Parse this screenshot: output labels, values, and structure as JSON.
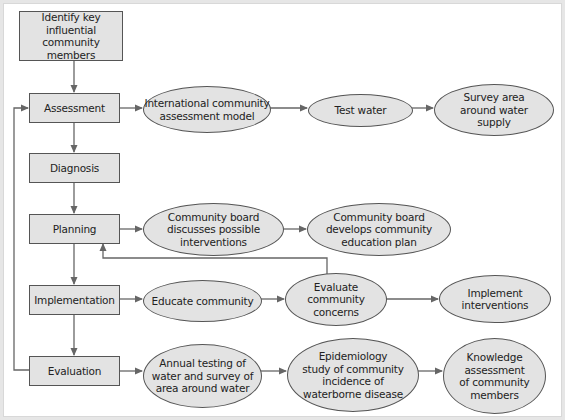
{
  "diagram": {
    "colors": {
      "node_fill": "#e3e3e3",
      "node_border": "#555555",
      "connector": "#666666",
      "background": "#ffffff",
      "frame": "#e6e6e6"
    },
    "phases": [
      {
        "id": "identify",
        "label": "Identify key\ninfluential\ncommunity members"
      },
      {
        "id": "assessment",
        "label": "Assessment"
      },
      {
        "id": "diagnosis",
        "label": "Diagnosis"
      },
      {
        "id": "planning",
        "label": "Planning"
      },
      {
        "id": "implementation",
        "label": "Implementation"
      },
      {
        "id": "evaluation",
        "label": "Evaluation"
      }
    ],
    "activities": {
      "assessment": [
        {
          "id": "intl-model",
          "label": "International community\nassessment model"
        },
        {
          "id": "test-water",
          "label": "Test water"
        },
        {
          "id": "survey-area",
          "label": "Survey area\naround water\nsupply"
        }
      ],
      "planning": [
        {
          "id": "board-discusses",
          "label": "Community board\ndiscusses possible\ninterventions"
        },
        {
          "id": "board-develops",
          "label": "Community board\ndevelops community\neducation plan"
        }
      ],
      "implementation": [
        {
          "id": "educate",
          "label": "Educate community"
        },
        {
          "id": "evaluate-concerns",
          "label": "Evaluate community\nconcerns"
        },
        {
          "id": "implement-interventions",
          "label": "Implement\ninterventions"
        }
      ],
      "evaluation": [
        {
          "id": "annual-testing",
          "label": "Annual testing of\nwater and survey of\narea around water"
        },
        {
          "id": "epidemiology",
          "label": "Epidemiology\nstudy of community\nincidence of\nwaterborne disease"
        },
        {
          "id": "knowledge",
          "label": "Knowledge\nassessment\nof community\nmembers"
        }
      ]
    },
    "edges": [
      [
        "identify",
        "assessment"
      ],
      [
        "assessment",
        "diagnosis"
      ],
      [
        "diagnosis",
        "planning"
      ],
      [
        "planning",
        "implementation"
      ],
      [
        "implementation",
        "evaluation"
      ],
      [
        "evaluation",
        "assessment"
      ],
      [
        "assessment",
        "intl-model"
      ],
      [
        "intl-model",
        "test-water"
      ],
      [
        "test-water",
        "survey-area"
      ],
      [
        "planning",
        "board-discusses"
      ],
      [
        "board-discusses",
        "board-develops"
      ],
      [
        "evaluate-concerns",
        "planning"
      ],
      [
        "implementation",
        "educate"
      ],
      [
        "educate",
        "evaluate-concerns"
      ],
      [
        "evaluate-concerns",
        "implement-interventions"
      ],
      [
        "evaluation",
        "annual-testing"
      ],
      [
        "annual-testing",
        "epidemiology"
      ],
      [
        "epidemiology",
        "knowledge"
      ]
    ]
  }
}
